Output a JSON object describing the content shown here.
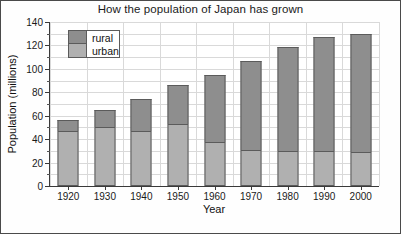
{
  "chart_data": {
    "type": "bar",
    "subtype": "stacked-bar",
    "title": "How the population of Japan has grown",
    "xlabel": "Year",
    "ylabel": "Population (millions)",
    "categories": [
      "1920",
      "1930",
      "1940",
      "1950",
      "1960",
      "1970",
      "1980",
      "1990",
      "2000"
    ],
    "series": [
      {
        "name": "urban",
        "color": "#b0b0b0",
        "values": [
          47,
          50,
          47,
          53,
          38,
          31,
          30,
          30,
          29
        ]
      },
      {
        "name": "rural",
        "color": "#8e8e8e",
        "values": [
          9,
          15,
          27,
          33,
          57,
          76,
          89,
          97,
          101
        ]
      }
    ],
    "totals": [
      56,
      65,
      74,
      86,
      95,
      107,
      119,
      127,
      130
    ],
    "ylim": [
      0,
      140
    ],
    "ytick_major": [
      0,
      20,
      40,
      60,
      80,
      100,
      120,
      140
    ],
    "ytick_minor": [
      10,
      30,
      50,
      70,
      90,
      110,
      130
    ],
    "ytick_labels": [
      "0",
      "20",
      "40",
      "60",
      "80",
      "100",
      "120",
      "140"
    ],
    "grid": true,
    "grid_color": "#d9d9d9",
    "legend_position": "top-left",
    "axis_color": "#3a3a3a",
    "bar_outline_color": "#5b5b5b"
  },
  "legend": {
    "entries": [
      {
        "label": "rural"
      },
      {
        "label": "urban"
      }
    ]
  }
}
